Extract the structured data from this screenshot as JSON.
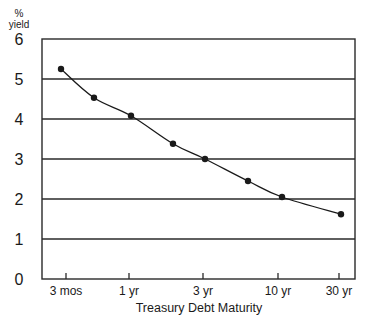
{
  "chart_data": {
    "type": "line",
    "title": "",
    "xlabel": "Treasury Debt Maturity",
    "ylabel": "% yield",
    "ylabel_lines": [
      "%",
      "yield"
    ],
    "ylim": [
      0,
      6
    ],
    "yticks": [
      0,
      1,
      2,
      3,
      4,
      5,
      6
    ],
    "grid": "horizontal",
    "x_ticks": [
      {
        "label": "3 mos",
        "px": 66
      },
      {
        "label": "1 yr",
        "px": 129
      },
      {
        "label": "3 yr",
        "px": 203
      },
      {
        "label": "10 yr",
        "px": 278
      },
      {
        "label": "30 yr",
        "px": 339
      }
    ],
    "series": [
      {
        "name": "Treasury yield curve",
        "color": "#1a1a1a",
        "points": [
          {
            "maturity": "3 mos",
            "px": 61,
            "y": 5.25
          },
          {
            "maturity": "6 mos",
            "px": 94,
            "y": 4.53
          },
          {
            "maturity": "1 yr",
            "px": 131,
            "y": 4.08
          },
          {
            "maturity": "2 yr",
            "px": 173,
            "y": 3.38
          },
          {
            "maturity": "3 yr",
            "px": 205,
            "y": 3.0
          },
          {
            "maturity": "5 yr",
            "px": 248,
            "y": 2.45
          },
          {
            "maturity": "10 yr",
            "px": 282,
            "y": 2.05
          },
          {
            "maturity": "30 yr",
            "px": 341,
            "y": 1.62
          }
        ]
      }
    ],
    "plot_area": {
      "left": 42,
      "right": 355,
      "top": 39,
      "bottom": 279
    },
    "colors": {
      "axis": "#2a2a2a",
      "grid": "#2a2a2a",
      "line": "#1a1a1a"
    }
  }
}
